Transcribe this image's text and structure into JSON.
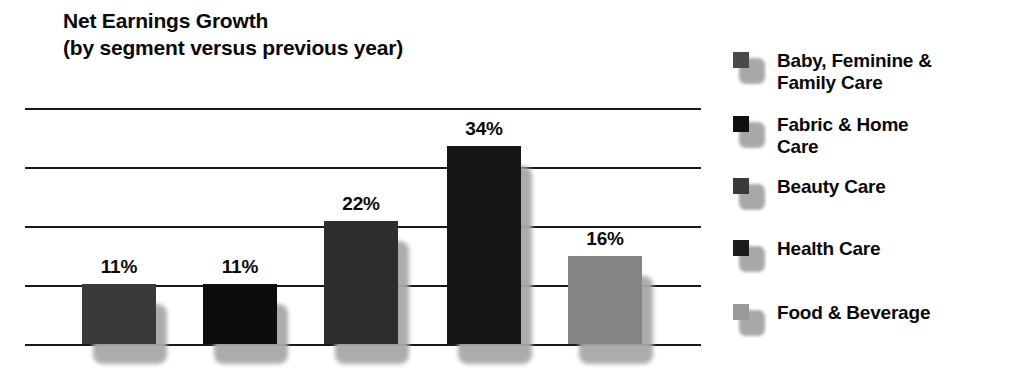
{
  "chart_data": {
    "type": "bar",
    "title": "Net Earnings Growth",
    "subtitle": "(by segment versus previous year)",
    "xlabel": "",
    "ylabel": "",
    "grid": true,
    "gridlines": 5,
    "ylim": [
      0,
      44
    ],
    "legend_position": "right",
    "categories": [
      "Baby, Feminine & Family Care",
      "Fabric & Home Care",
      "Beauty Care",
      "Health Care",
      "Food & Beverage"
    ],
    "values": [
      11,
      11,
      22,
      34,
      16
    ],
    "value_labels": [
      "11%",
      "11%",
      "22%",
      "34%",
      "16%"
    ],
    "colors": [
      "#3a3a3a",
      "#0d0d0d",
      "#2e2e2e",
      "#161616",
      "#858585"
    ]
  },
  "legend": {
    "items": [
      {
        "label_line1": "Baby, Feminine &",
        "label_line2": "Family Care",
        "color": "#4a4a4a"
      },
      {
        "label_line1": "Fabric & Home",
        "label_line2": "Care",
        "color": "#111111"
      },
      {
        "label_line1": "Beauty Care",
        "label_line2": "",
        "color": "#3a3a3a"
      },
      {
        "label_line1": "Health Care",
        "label_line2": "",
        "color": "#1c1c1c"
      },
      {
        "label_line1": "Food & Beverage",
        "label_line2": "",
        "color": "#9a9a9a"
      }
    ]
  },
  "colors": {
    "background": "#ffffff",
    "gridline": "#1a1a1a",
    "text": "#0a0a0a",
    "shadow": "#a8a8a8"
  }
}
